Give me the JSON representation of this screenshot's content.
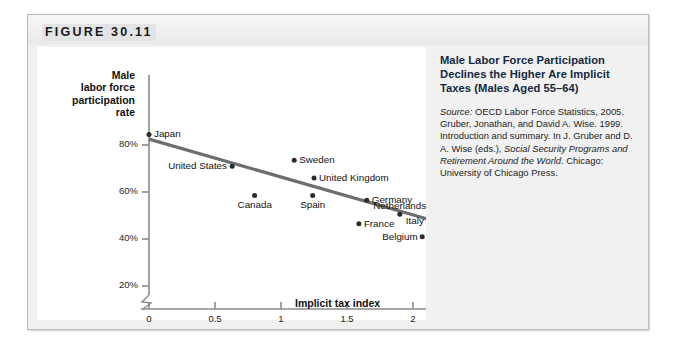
{
  "figure": {
    "label": "FIGURE 30.11",
    "caption_title": "Male Labor Force Participation Declines the Higher Are Implicit Taxes (Males Aged 55–64)",
    "source_lead": "Source:",
    "source_body": " OECD Labor Force Statistics, 2005. Gruber, Jonathan, and David A. Wise. 1999. Introduction and summary. In J. Gruber and D. A. Wise (eds.), ",
    "source_book": "Social Security Programs and Retirement Around the World",
    "source_tail": ". Chicago: University of Chicago Press."
  },
  "chart_data": {
    "type": "scatter",
    "title": "Male Labor Force Participation Declines the Higher Are Implicit Taxes (Males Aged 55–64)",
    "xlabel": "Implicit tax index",
    "ylabel": "Male labor force participation rate",
    "xlim": [
      -0.1,
      2.35
    ],
    "ylim": [
      14,
      90
    ],
    "xticks": [
      "0",
      "0.5",
      "1",
      "1.5",
      "2"
    ],
    "xtick_values": [
      0,
      0.5,
      1,
      1.5,
      2
    ],
    "yticks": [
      "20%",
      "40%",
      "60%",
      "80%"
    ],
    "ytick_values": [
      20,
      40,
      60,
      80
    ],
    "grid": false,
    "legend": "none",
    "axis_break": true,
    "points": [
      {
        "name": "Japan",
        "x": 0.0,
        "y": 84.5,
        "label_side": "right"
      },
      {
        "name": "United States",
        "x": 0.63,
        "y": 71.0,
        "label_side": "left"
      },
      {
        "name": "Canada",
        "x": 0.8,
        "y": 58.5,
        "label_side": "below"
      },
      {
        "name": "Sweden",
        "x": 1.1,
        "y": 73.5,
        "label_side": "right"
      },
      {
        "name": "Spain",
        "x": 1.24,
        "y": 58.5,
        "label_side": "below"
      },
      {
        "name": "United Kingdom",
        "x": 1.25,
        "y": 66.0,
        "label_side": "right"
      },
      {
        "name": "Germany",
        "x": 1.65,
        "y": 56.5,
        "label_side": "right"
      },
      {
        "name": "France",
        "x": 1.59,
        "y": 46.5,
        "label_side": "right"
      },
      {
        "name": "Netherlands",
        "x": 1.9,
        "y": 50.5,
        "label_side": "above"
      },
      {
        "name": "Italy",
        "x": 2.12,
        "y": 47.5,
        "label_side": "left"
      },
      {
        "name": "Belgium",
        "x": 2.07,
        "y": 41.0,
        "label_side": "left"
      }
    ],
    "trendline": {
      "x0": 0.0,
      "y0": 82.5,
      "x1": 2.2,
      "y1": 47.0,
      "color": "#6e6e6e"
    }
  },
  "colors": {
    "point": "#2b2b2b",
    "axis": "#8a8a8a",
    "trend": "#6e6e6e",
    "panel": "#ffffff",
    "frame": "#f1f1f1",
    "caption_title": "#12293f"
  }
}
